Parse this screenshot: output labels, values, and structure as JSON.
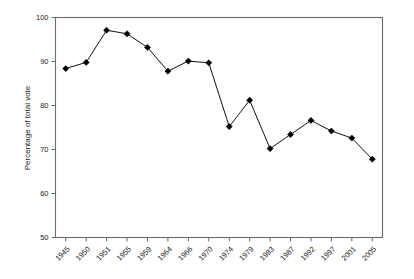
{
  "chart_data": {
    "type": "line",
    "title": "",
    "xlabel": "",
    "ylabel": "Percentage of total vote",
    "ylim": [
      50,
      100
    ],
    "ytick_labels": [
      "50",
      "60",
      "70",
      "80",
      "90",
      "100"
    ],
    "ytick_values": [
      50,
      60,
      70,
      80,
      90,
      100
    ],
    "grid": false,
    "legend": "none",
    "categories": [
      "1945",
      "1950",
      "1951",
      "1955",
      "1959",
      "1964",
      "1966",
      "1970",
      "1974",
      "1979",
      "1983",
      "1987",
      "1992",
      "1997",
      "2001",
      "2005"
    ],
    "values": [
      88.4,
      89.8,
      97.1,
      96.3,
      93.2,
      87.8,
      90.1,
      89.7,
      75.2,
      81.2,
      70.2,
      73.4,
      76.6,
      74.2,
      72.6,
      67.8
    ],
    "series": [
      {
        "name": "Percentage of total vote",
        "values": [
          88.4,
          89.8,
          97.1,
          96.3,
          93.2,
          87.8,
          90.1,
          89.7,
          75.2,
          81.2,
          70.2,
          73.4,
          76.6,
          74.2,
          72.6,
          67.8
        ]
      }
    ],
    "marker": "filled-diamond",
    "line_color": "#111111",
    "marker_color": "#000000",
    "axis_color": "#6b6b6b",
    "background_color": "#ffffff"
  }
}
